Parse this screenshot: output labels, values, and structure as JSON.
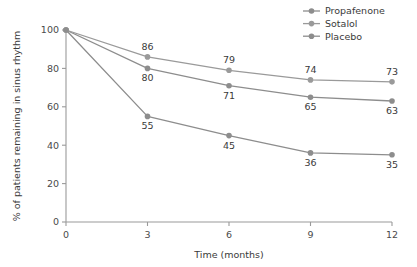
{
  "chart_data": {
    "type": "line",
    "title": "",
    "subtitle": "",
    "xlabel": "Time (months)",
    "ylabel": "% of patients remaining in sinus rhythm",
    "x": [
      0,
      3,
      6,
      9,
      12
    ],
    "xtick_labels": [
      "0",
      "3",
      "6",
      "9",
      "12"
    ],
    "ytick_labels": [
      "0",
      "20",
      "40",
      "60",
      "80",
      "100"
    ],
    "ytick_values": [
      0,
      20,
      40,
      60,
      80,
      100
    ],
    "xlim": [
      0,
      12
    ],
    "ylim": [
      0,
      100
    ],
    "grid": false,
    "legend_position": "top-right",
    "series": [
      {
        "name": "Propafenone",
        "color": "#8d8d8d",
        "marker": "circle",
        "values": [
          100,
          80,
          71,
          65,
          63
        ],
        "value_labels": [
          "",
          "80",
          "71",
          "65",
          "63"
        ],
        "label_placement": "below"
      },
      {
        "name": "Sotalol",
        "color": "#9a9a9a",
        "marker": "circle",
        "values": [
          100,
          86,
          79,
          74,
          73
        ],
        "value_labels": [
          "",
          "86",
          "79",
          "74",
          "73"
        ],
        "label_placement": "above"
      },
      {
        "name": "Placebo",
        "color": "#8d8d8d",
        "marker": "circle",
        "values": [
          100,
          55,
          45,
          36,
          35
        ],
        "value_labels": [
          "",
          "55",
          "45",
          "36",
          "35"
        ],
        "label_placement": "below"
      }
    ]
  },
  "axes": {
    "x_title": "Time (months)",
    "y_title": "% of patients remaining in sinus rhythm"
  },
  "legend": {
    "items": [
      {
        "label": "Propafenone"
      },
      {
        "label": "Sotalol"
      },
      {
        "label": "Placebo"
      }
    ]
  },
  "colors": {
    "line": "#8d8d8d",
    "axis": "#9a9a9a",
    "text": "#3a3a3a"
  }
}
